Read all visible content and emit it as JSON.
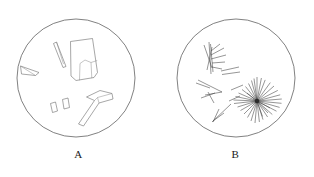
{
  "figure": {
    "background_color": "#ffffff",
    "outline_color": "#4a4a4a",
    "crystal_color": "#6b6b6b",
    "needle_color": "#3f3f3f",
    "panel_count": 2
  },
  "panels": [
    {
      "label": "A",
      "icon_name": "blocky-crystal-field-icon",
      "circle": {
        "cx": 76,
        "cy": 78,
        "r": 59
      },
      "particle_type": "blocky angular crystal fragments",
      "particle_count": 6,
      "particles": [
        {
          "name": "large-tabular-crystal",
          "outline": "70.5,41.5 92.5,38.5 97.5,72.5 94.0,77.5 76.0,80.5 71.0,76.0",
          "facets": [
            "79.5,80.3 80.0,63.5 85.0,60.0 91.0,62.5 91.8,78.2",
            "91.0,62.5 97.2,60.5"
          ]
        },
        {
          "name": "thin-lath-crystal-upper-left",
          "outline": "53.5,43.5 56.5,42.0 66.0,66.5 63.0,67.5",
          "facets": [
            "56.5,42.0 63.5,64.0"
          ]
        },
        {
          "name": "sliver-crystal-left-edge",
          "outline": "20.5,66.0 39.0,72.5 35.5,75.5 21.5,74.0",
          "facets": [
            "20.5,66.0 35.5,75.5"
          ]
        },
        {
          "name": "small-parallelogram-left",
          "outline": "50.5,103.5 55.5,102.0 57.5,111.0 52.5,112.5",
          "facets": []
        },
        {
          "name": "small-parallelogram-right",
          "outline": "62.5,99.5 68.0,98.0 69.5,107.5 64.0,109.0",
          "facets": []
        },
        {
          "name": "hammer-shaped-crystal",
          "outline": "86.5,97.0 100.0,90.5 112.0,93.5 113.0,99.0 99.0,103.0 83.5,126.0 78.5,124.0 94.5,100.5",
          "facets": [
            "99.0,103.0 97.5,97.5",
            "97.5,97.5 112.0,93.5",
            "94.5,100.5 97.5,97.5"
          ]
        }
      ]
    },
    {
      "label": "B",
      "icon_name": "acicular-crystal-field-icon",
      "circle": {
        "cx": 236,
        "cy": 78,
        "r": 59
      },
      "particle_type": "acicular needle crystals with radial starburst cluster",
      "starburst": {
        "name": "radial-needle-starburst",
        "cx": 257,
        "cy": 101,
        "ray_count": 34,
        "ray_min_length": 11,
        "ray_max_length": 25,
        "core_radius": 2.2
      },
      "sheaf": {
        "name": "feather-sheaf-needle-cluster",
        "origin_x": 210,
        "origin_y": 58,
        "needle_count": 9
      },
      "loose_needles": [
        "198,80 222,92",
        "221,71 239,67",
        "222,74 240,72",
        "231,90 243,85",
        "205,95 222,92",
        "201,98 215,93",
        "208,92 214,103",
        "212,122 231,104",
        "213,122 219,109",
        "229,101 240,96",
        "196,83 210,88"
      ]
    }
  ]
}
